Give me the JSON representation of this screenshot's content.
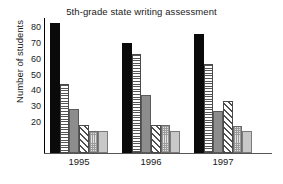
{
  "chart_data": {
    "type": "bar",
    "title": "5th-grade state writing assessment",
    "xlabel": "",
    "ylabel": "Number of students",
    "categories": [
      "1995",
      "1996",
      "1997"
    ],
    "ylim": [
      0,
      86
    ],
    "yticks": [
      20,
      30,
      40,
      50,
      60,
      70,
      80
    ],
    "ytick_labels": [
      "20",
      "30",
      "40",
      "50",
      "60",
      "70",
      "80"
    ],
    "grid": false,
    "legend": "none",
    "series": [
      {
        "name": "series-1",
        "pattern": "solid-black",
        "values": [
          83,
          70,
          76
        ]
      },
      {
        "name": "series-2",
        "pattern": "horizontal-lines",
        "values": [
          44,
          63,
          57
        ]
      },
      {
        "name": "series-3",
        "pattern": "solid-gray",
        "values": [
          28,
          37,
          27
        ]
      },
      {
        "name": "series-4",
        "pattern": "diagonal-hatch",
        "values": [
          18,
          18,
          33
        ]
      },
      {
        "name": "series-5",
        "pattern": "dotted-light",
        "values": [
          14,
          18,
          17
        ]
      },
      {
        "name": "series-6",
        "pattern": "solid-light-gray",
        "values": [
          14,
          14,
          14
        ]
      }
    ]
  }
}
